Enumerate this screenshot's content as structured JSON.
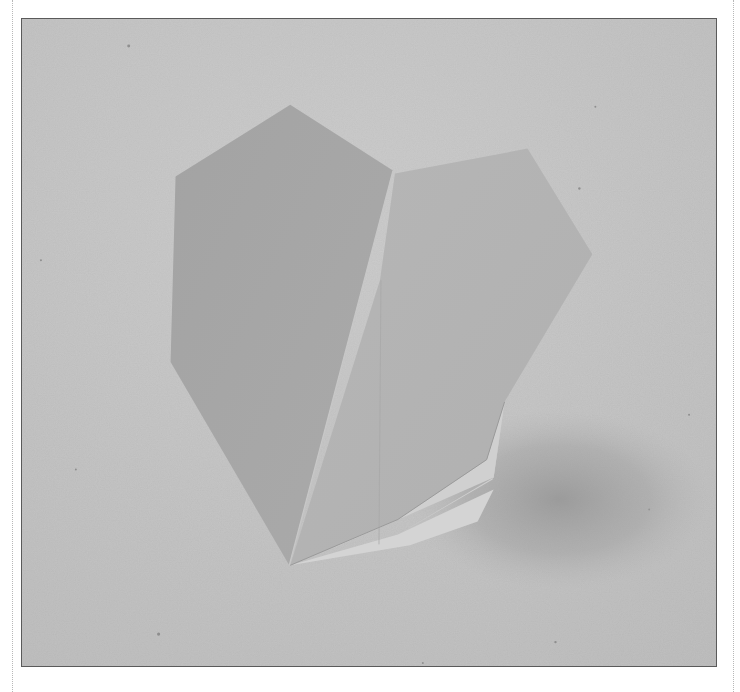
{
  "photo": {
    "subject": "Origami paper heart standing on a textured paper surface",
    "style": "grayscale photograph",
    "colors": {
      "background": "#c3c3c3",
      "background_light": "#cdcdcd",
      "shadow": "#9c9c9c",
      "left_panel": "#a6a6a6",
      "right_panel": "#b4b4b4",
      "back_flap": "#cfcfcf",
      "bottom_flap": "#d6d6d6",
      "frame_border": "#5a5a5a",
      "margin_rule": "#b8b8b8"
    }
  }
}
